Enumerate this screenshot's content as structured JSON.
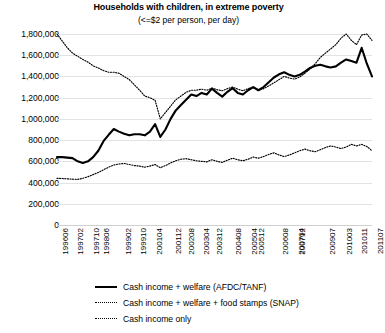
{
  "chart_data": {
    "type": "line",
    "title": "Households with children, in extreme poverty",
    "subtitle": "(<=$2 per person, per day)",
    "xlabel": "",
    "ylabel": "",
    "ylim": [
      0,
      1800000
    ],
    "yticks": [
      "0",
      "200,000",
      "400,000",
      "600,000",
      "800,000",
      "1,000,000",
      "1,200,000",
      "1,400,000",
      "1,600,000",
      "1,800,000"
    ],
    "ytick_values": [
      0,
      200000,
      400000,
      600000,
      800000,
      1000000,
      1200000,
      1400000,
      1600000,
      1800000
    ],
    "grid": true,
    "legend_position": "bottom-left",
    "x": [
      "199606",
      "199609",
      "199612",
      "199703",
      "199706",
      "199709",
      "199712",
      "199803",
      "199806",
      "199809",
      "199812",
      "199903",
      "199906",
      "199909",
      "199912",
      "200003",
      "200006",
      "200009",
      "200012",
      "200103",
      "200106",
      "200109",
      "200112",
      "200203",
      "200206",
      "200209",
      "200212",
      "200303",
      "200306",
      "200309",
      "200312",
      "200403",
      "200406",
      "200409",
      "200412",
      "200503",
      "200506",
      "200509",
      "200512",
      "200603",
      "200606",
      "200609",
      "200612",
      "200703",
      "200706",
      "200709",
      "200712",
      "200803",
      "200806",
      "200809",
      "200812",
      "200903",
      "200906",
      "200909",
      "200912",
      "201003",
      "201006",
      "201009",
      "201012",
      "201103",
      "201106",
      "201107"
    ],
    "xtick_labels": [
      "199606",
      "199702",
      "199710",
      "199806",
      "199902",
      "199910",
      "200104",
      "200112",
      "200208",
      "200304",
      "200312",
      "200408",
      "200504",
      "200512",
      "200608",
      "200704",
      "200712",
      "200907",
      "201003",
      "201011",
      "201107"
    ],
    "series": [
      {
        "name": "Cash income + welfare (AFDC/TANF)",
        "style": "solid",
        "values": [
          640000,
          640000,
          635000,
          630000,
          600000,
          585000,
          600000,
          640000,
          700000,
          790000,
          850000,
          905000,
          880000,
          860000,
          845000,
          855000,
          855000,
          845000,
          880000,
          950000,
          830000,
          900000,
          1000000,
          1080000,
          1130000,
          1180000,
          1230000,
          1215000,
          1245000,
          1230000,
          1285000,
          1245000,
          1210000,
          1255000,
          1290000,
          1245000,
          1230000,
          1270000,
          1300000,
          1270000,
          1300000,
          1345000,
          1390000,
          1420000,
          1440000,
          1415000,
          1400000,
          1415000,
          1445000,
          1480000,
          1500000,
          1510000,
          1495000,
          1485000,
          1495000,
          1530000,
          1560000,
          1545000,
          1530000,
          1670000,
          1520000,
          1400000
        ]
      },
      {
        "name": "Cash income + welfare + food stamps (SNAP)",
        "style": "dotted",
        "values": [
          1800000,
          1735000,
          1670000,
          1620000,
          1590000,
          1560000,
          1535000,
          1500000,
          1480000,
          1455000,
          1440000,
          1440000,
          1430000,
          1400000,
          1370000,
          1320000,
          1270000,
          1215000,
          1200000,
          1175000,
          1000000,
          1060000,
          1120000,
          1180000,
          1215000,
          1250000,
          1270000,
          1270000,
          1280000,
          1270000,
          1290000,
          1275000,
          1265000,
          1285000,
          1300000,
          1280000,
          1265000,
          1285000,
          1300000,
          1270000,
          1285000,
          1310000,
          1340000,
          1370000,
          1400000,
          1385000,
          1375000,
          1395000,
          1430000,
          1470000,
          1520000,
          1580000,
          1620000,
          1660000,
          1700000,
          1760000,
          1800000,
          1740000,
          1700000,
          1790000,
          1800000,
          1740000
        ]
      },
      {
        "name": "Cash income only",
        "style": "dotted",
        "values": [
          440000,
          438000,
          435000,
          432000,
          430000,
          440000,
          455000,
          475000,
          495000,
          520000,
          545000,
          565000,
          575000,
          580000,
          570000,
          560000,
          555000,
          545000,
          555000,
          570000,
          540000,
          560000,
          585000,
          605000,
          620000,
          625000,
          615000,
          605000,
          600000,
          595000,
          615000,
          600000,
          590000,
          610000,
          630000,
          615000,
          605000,
          620000,
          640000,
          630000,
          645000,
          665000,
          680000,
          660000,
          645000,
          660000,
          680000,
          700000,
          715000,
          700000,
          690000,
          710000,
          730000,
          745000,
          735000,
          720000,
          735000,
          760000,
          745000,
          760000,
          740000,
          700000
        ]
      }
    ]
  },
  "legend": {
    "items": [
      {
        "label": "Cash income + welfare (AFDC/TANF)",
        "style": "solid"
      },
      {
        "label": "Cash income + welfare + food stamps (SNAP)",
        "style": "dotted"
      },
      {
        "label": "Cash income only",
        "style": "dotted"
      }
    ]
  }
}
